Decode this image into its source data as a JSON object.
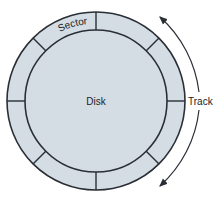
{
  "diagram": {
    "labels": {
      "sector": "Sector",
      "disk": "Disk",
      "track": "Track"
    },
    "sector_count": 8,
    "colors": {
      "fill": "#d5dde4",
      "stroke": "#2a2f36",
      "text": "#222222"
    }
  }
}
